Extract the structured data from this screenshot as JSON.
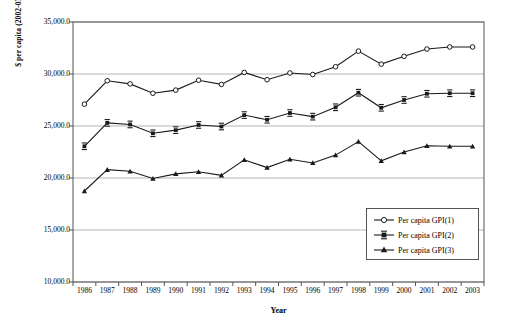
{
  "chart_data": {
    "type": "line",
    "title": "",
    "xlabel": "Year",
    "ylabel": "$ per capita (2002-03 prices)",
    "categories": [
      "1986",
      "1987",
      "1988",
      "1989",
      "1990",
      "1991",
      "1992",
      "1993",
      "1994",
      "1995",
      "1996",
      "1997",
      "1998",
      "1999",
      "2000",
      "2001",
      "2002",
      "2003"
    ],
    "ylim": [
      10000,
      35000
    ],
    "yticks": [
      "10,000.0",
      "15,000.0",
      "20,000.0",
      "25,000.0",
      "30,000.0",
      "35,000.0"
    ],
    "ytick_values": [
      10000,
      15000,
      20000,
      25000,
      30000,
      35000
    ],
    "grid": true,
    "legend_position": "lower-right",
    "series": [
      {
        "name": "Per capita GPI(1)",
        "marker": "open-circle",
        "values": [
          27100,
          29350,
          29050,
          28150,
          28450,
          29400,
          29000,
          30150,
          29450,
          30100,
          29950,
          30700,
          32200,
          30950,
          31700,
          32400,
          32600,
          32600
        ]
      },
      {
        "name": "Per capita GPI(2)",
        "marker": "filled-square",
        "values": [
          23050,
          25300,
          25150,
          24300,
          24600,
          25100,
          24950,
          26050,
          25600,
          26250,
          25900,
          26800,
          28200,
          26750,
          27500,
          28100,
          28150,
          28150
        ]
      },
      {
        "name": "Per capita GPI(3)",
        "marker": "filled-triangle",
        "values": [
          18750,
          20800,
          20650,
          19950,
          20400,
          20600,
          20250,
          21750,
          21000,
          21800,
          21450,
          22200,
          23500,
          21650,
          22500,
          23100,
          23050,
          23050
        ]
      }
    ]
  },
  "legend": {
    "items": [
      {
        "label": "Per capita GPI(1)"
      },
      {
        "label": "Per capita GPI(2)"
      },
      {
        "label": "Per capita GPI(3)"
      }
    ]
  },
  "colors": {
    "line": "#1a1a1a",
    "grid": "#b5b5b5",
    "frame": "#555555",
    "background": "#ffffff"
  }
}
